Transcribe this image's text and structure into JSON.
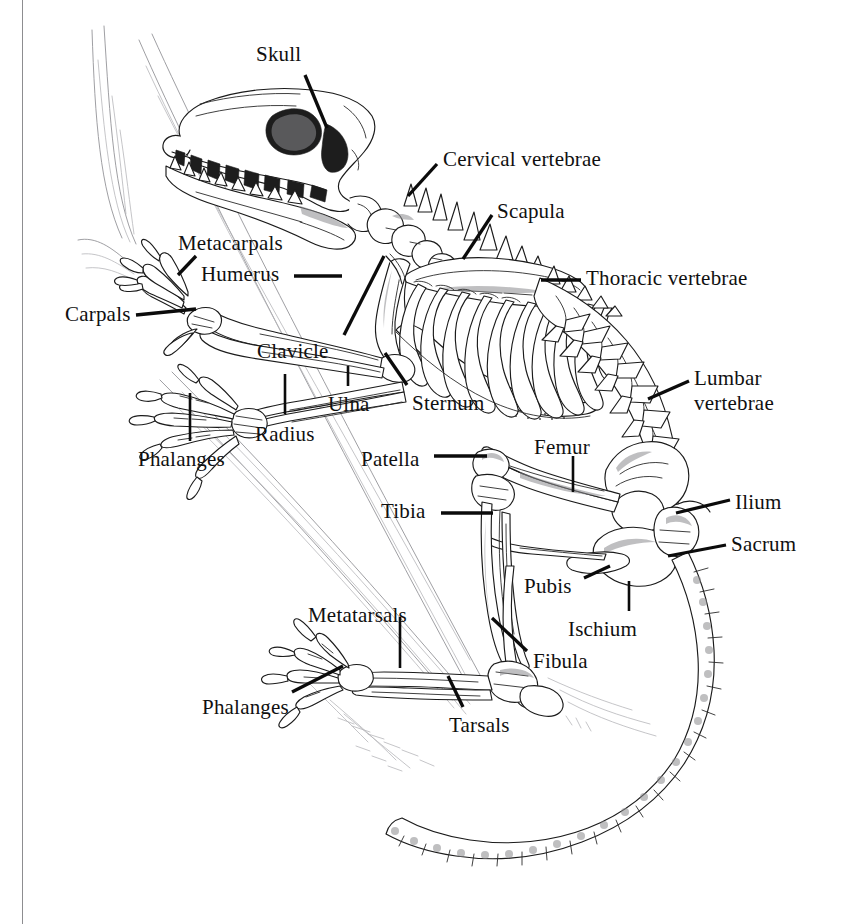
{
  "figure": {
    "style": "pen-and-ink line drawing",
    "background_color": "#ffffff",
    "ink_color": "#101010",
    "frame": {
      "left_rule_x": 22,
      "color": "#8d8d90"
    }
  },
  "labels": [
    {
      "id": "skull",
      "text": "Skull",
      "x": 256,
      "y": 43,
      "align": "left",
      "lines": 1
    },
    {
      "id": "cervical-vertebrae",
      "text": "Cervical vertebrae",
      "x": 443,
      "y": 148,
      "align": "left",
      "lines": 1
    },
    {
      "id": "scapula",
      "text": "Scapula",
      "x": 497,
      "y": 200,
      "align": "left",
      "lines": 1
    },
    {
      "id": "thoracic-vertebrae",
      "text": "Thoracic vertebrae",
      "x": 586,
      "y": 267,
      "align": "left",
      "lines": 1
    },
    {
      "id": "metacarpals",
      "text": "Metacarpals",
      "x": 178,
      "y": 232,
      "align": "left",
      "lines": 1
    },
    {
      "id": "humerus",
      "text": "Humerus",
      "x": 201,
      "y": 263,
      "align": "left",
      "lines": 1
    },
    {
      "id": "carpals",
      "text": "Carpals",
      "x": 65,
      "y": 303,
      "align": "left",
      "lines": 1
    },
    {
      "id": "clavicle",
      "text": "Clavicle",
      "x": 257,
      "y": 340,
      "align": "left",
      "lines": 1
    },
    {
      "id": "sternum",
      "text": "Sternum",
      "x": 412,
      "y": 392,
      "align": "left",
      "lines": 1
    },
    {
      "id": "ulna",
      "text": "Ulna",
      "x": 328,
      "y": 393,
      "align": "left",
      "lines": 1
    },
    {
      "id": "radius",
      "text": "Radius",
      "x": 255,
      "y": 423,
      "align": "left",
      "lines": 1
    },
    {
      "id": "phalanges-fore",
      "text": "Phalanges",
      "x": 138,
      "y": 448,
      "align": "left",
      "lines": 1
    },
    {
      "id": "lumbar-vertebrae",
      "text": "Lumbar\nvertebrae",
      "x": 694,
      "y": 366,
      "align": "left",
      "lines": 2
    },
    {
      "id": "patella",
      "text": "Patella",
      "x": 361,
      "y": 448,
      "align": "left",
      "lines": 1
    },
    {
      "id": "femur",
      "text": "Femur",
      "x": 534,
      "y": 436,
      "align": "left",
      "lines": 1
    },
    {
      "id": "tibia",
      "text": "Tibia",
      "x": 381,
      "y": 500,
      "align": "left",
      "lines": 1
    },
    {
      "id": "ilium",
      "text": "Ilium",
      "x": 735,
      "y": 491,
      "align": "left",
      "lines": 1
    },
    {
      "id": "sacrum",
      "text": "Sacrum",
      "x": 731,
      "y": 533,
      "align": "left",
      "lines": 1
    },
    {
      "id": "pubis",
      "text": "Pubis",
      "x": 524,
      "y": 575,
      "align": "left",
      "lines": 1
    },
    {
      "id": "ischium",
      "text": "Ischium",
      "x": 568,
      "y": 618,
      "align": "left",
      "lines": 1
    },
    {
      "id": "metatarsals",
      "text": "Metatarsals",
      "x": 308,
      "y": 604,
      "align": "left",
      "lines": 1
    },
    {
      "id": "fibula",
      "text": "Fibula",
      "x": 533,
      "y": 650,
      "align": "left",
      "lines": 1
    },
    {
      "id": "phalanges-hind",
      "text": "Phalanges",
      "x": 202,
      "y": 696,
      "align": "left",
      "lines": 1
    },
    {
      "id": "tarsals",
      "text": "Tarsals",
      "x": 449,
      "y": 714,
      "align": "left",
      "lines": 1
    }
  ],
  "leader_lines": [
    {
      "id": "leader-skull",
      "x1": 305,
      "y1": 75,
      "x2": 327,
      "y2": 128,
      "weight": 3.3
    },
    {
      "id": "leader-cervical",
      "x1": 437,
      "y1": 164,
      "x2": 408,
      "y2": 196,
      "weight": 3.3
    },
    {
      "id": "leader-scapula",
      "x1": 492,
      "y1": 215,
      "x2": 463,
      "y2": 259,
      "weight": 3.3
    },
    {
      "id": "leader-thoracic",
      "x1": 581,
      "y1": 280,
      "x2": 541,
      "y2": 280,
      "weight": 3.3
    },
    {
      "id": "leader-metacarpals",
      "x1": 196,
      "y1": 256,
      "x2": 178,
      "y2": 275,
      "weight": 3.3
    },
    {
      "id": "leader-humerus",
      "x1": 294,
      "y1": 276,
      "x2": 342,
      "y2": 276,
      "weight": 3.3
    },
    {
      "id": "leader-carpals",
      "x1": 136,
      "y1": 315,
      "x2": 196,
      "y2": 309,
      "weight": 3.3
    },
    {
      "id": "leader-clavicle",
      "x1": 344,
      "y1": 335,
      "x2": 384,
      "y2": 256,
      "weight": 3.3
    },
    {
      "id": "leader-sternum",
      "x1": 407,
      "y1": 385,
      "x2": 385,
      "y2": 355,
      "weight": 3.3
    },
    {
      "id": "leader-ulna",
      "x1": 348,
      "y1": 368,
      "x2": 348,
      "y2": 385,
      "weight": 2.6
    },
    {
      "id": "leader-radius",
      "x1": 285,
      "y1": 375,
      "x2": 285,
      "y2": 415,
      "weight": 2.6
    },
    {
      "id": "leader-phalanges-fore",
      "x1": 190,
      "y1": 394,
      "x2": 190,
      "y2": 441,
      "weight": 2.6
    },
    {
      "id": "leader-lumbar",
      "x1": 689,
      "y1": 381,
      "x2": 648,
      "y2": 399,
      "weight": 3.3
    },
    {
      "id": "leader-patella",
      "x1": 434,
      "y1": 456,
      "x2": 487,
      "y2": 456,
      "weight": 3.3
    },
    {
      "id": "leader-femur",
      "x1": 573,
      "y1": 457,
      "x2": 573,
      "y2": 492,
      "weight": 2.6
    },
    {
      "id": "leader-tibia",
      "x1": 441,
      "y1": 513,
      "x2": 493,
      "y2": 513,
      "weight": 3.3
    },
    {
      "id": "leader-ilium",
      "x1": 730,
      "y1": 500,
      "x2": 676,
      "y2": 513,
      "weight": 3.3
    },
    {
      "id": "leader-sacrum",
      "x1": 726,
      "y1": 545,
      "x2": 668,
      "y2": 556,
      "weight": 3.3
    },
    {
      "id": "leader-pubis",
      "x1": 584,
      "y1": 578,
      "x2": 608,
      "y2": 567,
      "weight": 3.3
    },
    {
      "id": "leader-ischium",
      "x1": 629,
      "y1": 612,
      "x2": 629,
      "y2": 582,
      "weight": 2.6
    },
    {
      "id": "leader-metatarsals",
      "x1": 400,
      "y1": 618,
      "x2": 400,
      "y2": 668,
      "weight": 2.6
    },
    {
      "id": "leader-fibula",
      "x1": 527,
      "y1": 651,
      "x2": 492,
      "y2": 618,
      "weight": 3.3
    },
    {
      "id": "leader-phalanges-hind",
      "x1": 292,
      "y1": 692,
      "x2": 343,
      "y2": 666,
      "weight": 3.3
    },
    {
      "id": "leader-tarsals",
      "x1": 463,
      "y1": 707,
      "x2": 448,
      "y2": 676,
      "weight": 3.3
    }
  ],
  "skeleton_regions": [
    {
      "id": "skull",
      "name": "Skull with teeth and orbit"
    },
    {
      "id": "cervical-vertebrae",
      "name": "Cervical vertebrae (neck)"
    },
    {
      "id": "scapula",
      "name": "Scapula (shoulder blade)"
    },
    {
      "id": "thoracic-vertebrae",
      "name": "Thoracic vertebrae with rib cage"
    },
    {
      "id": "lumbar-vertebrae",
      "name": "Lumbar vertebrae"
    },
    {
      "id": "sacrum",
      "name": "Sacrum"
    },
    {
      "id": "pelvis",
      "name": "Pelvis: ilium, ischium, pubis"
    },
    {
      "id": "forelimb",
      "name": "Forelimb: humerus, radius, ulna, carpals, metacarpals, phalanges"
    },
    {
      "id": "hindlimb",
      "name": "Hindlimb: femur, patella, tibia, fibula, tarsals, metatarsals, phalanges"
    },
    {
      "id": "caudal-vertebrae",
      "name": "Caudal vertebrae (tail)"
    },
    {
      "id": "branch",
      "name": "Branch / perch the animal stands on"
    }
  ]
}
